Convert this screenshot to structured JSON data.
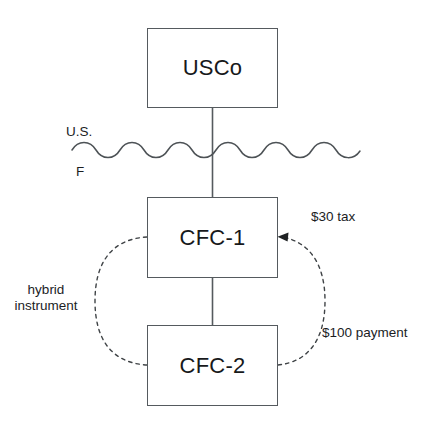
{
  "diagram": {
    "type": "entity-ownership-flow",
    "background_color": "#ffffff",
    "line_color": "#555a5e",
    "text_color": "#1b1d1f",
    "entities": [
      {
        "id": "usco",
        "label": "USCo"
      },
      {
        "id": "cfc1",
        "label": "CFC-1"
      },
      {
        "id": "cfc2",
        "label": "CFC-2"
      }
    ],
    "border_labels": {
      "above": "U.S.",
      "below": "F"
    },
    "annotations": {
      "tax": "$30 tax",
      "payment": "$100 payment",
      "hybrid_line_1": "hybrid",
      "hybrid_line_2": "instrument"
    }
  }
}
